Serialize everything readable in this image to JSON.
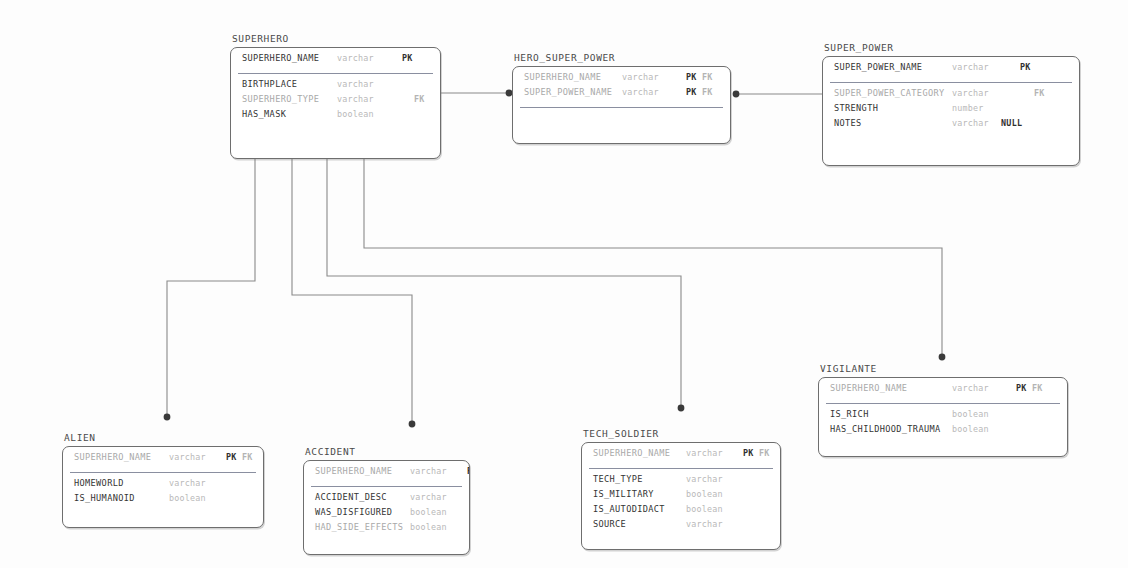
{
  "diagram": {
    "type": "entity-relationship-diagram",
    "line_color": "#8a8a8a",
    "box_border_color": "#6e6e6e",
    "accent_dot_color": "#3a3a3a"
  },
  "entities": [
    {
      "id": "superhero",
      "name": "SUPERHERO",
      "x": 230,
      "y": 33,
      "w": 211,
      "h": 112,
      "keys": [
        {
          "name": "SUPERHERO_NAME",
          "type": "varchar",
          "flags": "PK",
          "fk": "",
          "faded": false,
          "name_x": 0,
          "type_x": 95,
          "flag_x": 160
        }
      ],
      "attrs": [
        {
          "name": "BIRTHPLACE",
          "type": "varchar",
          "flags": "",
          "fk": "",
          "faded": false,
          "name_x": 0,
          "type_x": 95,
          "flag_x": 160
        },
        {
          "name": "SUPERHERO_TYPE",
          "type": "varchar",
          "flags": "",
          "fk": "FK",
          "faded": true,
          "name_x": 0,
          "type_x": 95,
          "flag_x": 172
        },
        {
          "name": "HAS_MASK",
          "type": "boolean",
          "flags": "",
          "fk": "",
          "faded": false,
          "name_x": 0,
          "type_x": 95,
          "flag_x": 160
        }
      ]
    },
    {
      "id": "hero_super_power",
      "name": "HERO_SUPER_POWER",
      "x": 512,
      "y": 52,
      "w": 219,
      "h": 78,
      "keys": [
        {
          "name": "SUPERHERO_NAME",
          "type": "varchar",
          "flags": "PK",
          "fk": "FK",
          "faded": true,
          "name_x": 0,
          "type_x": 98,
          "flag_x": 162
        },
        {
          "name": "SUPER_POWER_NAME",
          "type": "varchar",
          "flags": "PK",
          "fk": "FK",
          "faded": true,
          "name_x": 0,
          "type_x": 98,
          "flag_x": 162
        }
      ],
      "attrs": []
    },
    {
      "id": "super_power",
      "name": "SUPER_POWER",
      "x": 822,
      "y": 42,
      "w": 258,
      "h": 110,
      "keys": [
        {
          "name": "SUPER_POWER_NAME",
          "type": "varchar",
          "flags": "PK",
          "fk": "",
          "faded": false,
          "name_x": 0,
          "type_x": 118,
          "flag_x": 186
        }
      ],
      "attrs": [
        {
          "name": "SUPER_POWER_CATEGORY",
          "type": "varchar",
          "flags": "",
          "fk": "FK",
          "faded": true,
          "name_x": 0,
          "type_x": 118,
          "flag_x": 200
        },
        {
          "name": "STRENGTH",
          "type": "number",
          "flags": "",
          "fk": "",
          "faded": false,
          "name_x": 0,
          "type_x": 118,
          "flag_x": 186
        },
        {
          "name": "NOTES",
          "type": "varchar",
          "flags": "NULL",
          "fk": "",
          "faded": false,
          "name_x": 0,
          "type_x": 118,
          "flag_x": 167
        }
      ]
    },
    {
      "id": "alien",
      "name": "ALIEN",
      "x": 62,
      "y": 432,
      "w": 202,
      "h": 82,
      "keys": [
        {
          "name": "SUPERHERO_NAME",
          "type": "varchar",
          "flags": "PK",
          "fk": "FK",
          "faded": true,
          "name_x": 0,
          "type_x": 95,
          "flag_x": 152
        }
      ],
      "attrs": [
        {
          "name": "HOMEWORLD",
          "type": "varchar",
          "flags": "",
          "fk": "",
          "faded": false,
          "name_x": 0,
          "type_x": 95,
          "flag_x": 152
        },
        {
          "name": "IS_HUMANOID",
          "type": "boolean",
          "flags": "",
          "fk": "",
          "faded": false,
          "name_x": 0,
          "type_x": 95,
          "flag_x": 152
        }
      ]
    },
    {
      "id": "accident",
      "name": "ACCIDENT",
      "x": 303,
      "y": 446,
      "w": 167,
      "h": 95,
      "keys": [
        {
          "name": "SUPERHERO_NAME",
          "type": "varchar",
          "flags": "PK",
          "fk": "FK",
          "faded": true,
          "name_x": 0,
          "type_x": 95,
          "flag_x": 152
        }
      ],
      "attrs": [
        {
          "name": "ACCIDENT_DESC",
          "type": "varchar",
          "flags": "",
          "fk": "",
          "faded": false,
          "name_x": 0,
          "type_x": 95,
          "flag_x": 152
        },
        {
          "name": "WAS_DISFIGURED",
          "type": "boolean",
          "flags": "",
          "fk": "",
          "faded": false,
          "name_x": 0,
          "type_x": 95,
          "flag_x": 152
        },
        {
          "name": "HAD_SIDE_EFFECTS",
          "type": "boolean",
          "flags": "",
          "fk": "",
          "faded": true,
          "name_x": 0,
          "type_x": 95,
          "flag_x": 152
        }
      ]
    },
    {
      "id": "tech_soldier",
      "name": "TECH_SOLDIER",
      "x": 581,
      "y": 428,
      "w": 200,
      "h": 108,
      "keys": [
        {
          "name": "SUPERHERO_NAME",
          "type": "varchar",
          "flags": "PK",
          "fk": "FK",
          "faded": true,
          "name_x": 0,
          "type_x": 93,
          "flag_x": 150
        }
      ],
      "attrs": [
        {
          "name": "TECH_TYPE",
          "type": "varchar",
          "flags": "",
          "fk": "",
          "faded": false,
          "name_x": 0,
          "type_x": 93,
          "flag_x": 150
        },
        {
          "name": "IS_MILITARY",
          "type": "boolean",
          "flags": "",
          "fk": "",
          "faded": false,
          "name_x": 0,
          "type_x": 93,
          "flag_x": 150
        },
        {
          "name": "IS_AUTODIDACT",
          "type": "boolean",
          "flags": "",
          "fk": "",
          "faded": false,
          "name_x": 0,
          "type_x": 93,
          "flag_x": 150
        },
        {
          "name": "SOURCE",
          "type": "varchar",
          "flags": "",
          "fk": "",
          "faded": false,
          "name_x": 0,
          "type_x": 93,
          "flag_x": 150
        }
      ]
    },
    {
      "id": "vigilante",
      "name": "VIGILANTE",
      "x": 818,
      "y": 363,
      "w": 250,
      "h": 80,
      "keys": [
        {
          "name": "SUPERHERO_NAME",
          "type": "varchar",
          "flags": "PK",
          "fk": "FK",
          "faded": true,
          "name_x": 0,
          "type_x": 122,
          "flag_x": 186
        }
      ],
      "attrs": [
        {
          "name": "IS_RICH",
          "type": "boolean",
          "flags": "",
          "fk": "",
          "faded": false,
          "name_x": 0,
          "type_x": 122,
          "flag_x": 186
        },
        {
          "name": "HAS_CHILDHOOD_TRAUMA",
          "type": "boolean",
          "flags": "",
          "fk": "",
          "faded": false,
          "name_x": 0,
          "type_x": 122,
          "flag_x": 186
        }
      ]
    }
  ],
  "relationships": [
    {
      "id": "superhero-hero_super_power",
      "from": "SUPERHERO",
      "to": "HERO_SUPER_POWER",
      "path": "M441,93 L512,93",
      "dot": {
        "x": 509,
        "y": 93
      }
    },
    {
      "id": "super_power-hero_super_power",
      "from": "SUPER_POWER",
      "to": "HERO_SUPER_POWER",
      "path": "M822,94 L734,94",
      "dot": {
        "x": 736,
        "y": 94
      }
    },
    {
      "id": "superhero-alien",
      "from": "SUPERHERO",
      "to": "ALIEN",
      "path": "M255,145 L255,281 L167,281 L167,415",
      "dot": {
        "x": 167,
        "y": 417
      }
    },
    {
      "id": "superhero-accident",
      "from": "SUPERHERO",
      "to": "ACCIDENT",
      "path": "M292,145 L292,295 L412,295 L412,422",
      "dot": {
        "x": 412,
        "y": 424
      }
    },
    {
      "id": "superhero-tech_soldier",
      "from": "SUPERHERO",
      "to": "TECH_SOLDIER",
      "path": "M327,145 L327,276 L681,276 L681,406",
      "dot": {
        "x": 681,
        "y": 408
      }
    },
    {
      "id": "superhero-vigilante",
      "from": "SUPERHERO",
      "to": "VIGILANTE",
      "path": "M364,145 L364,248 L942,248 L942,355",
      "dot": {
        "x": 942,
        "y": 357
      }
    }
  ]
}
